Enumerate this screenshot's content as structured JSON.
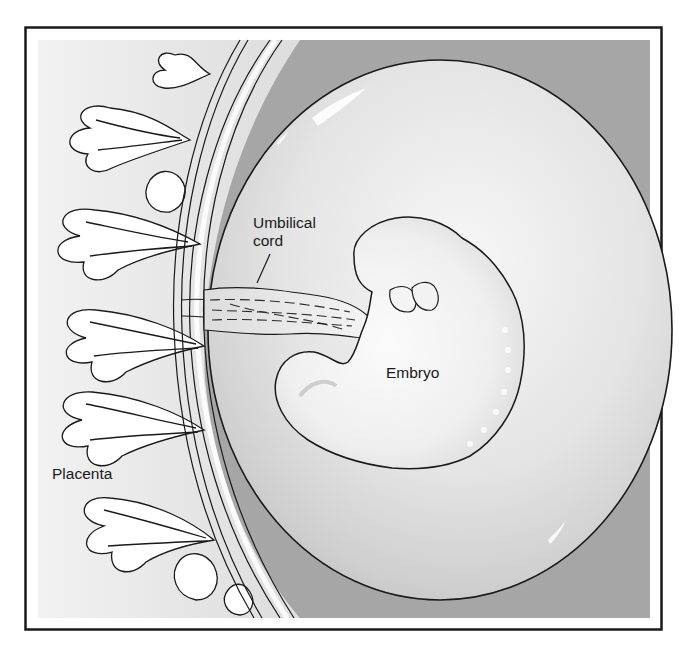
{
  "figure": {
    "type": "anatomical illustration",
    "labels": {
      "umbilical_cord_line1": "Umbilical",
      "umbilical_cord_line2": "cord",
      "embryo": "Embryo",
      "placenta": "Placenta"
    },
    "colors": {
      "frame": "#1a1a1a",
      "background_gray": "#bdbdbd",
      "light_field": "#ececec",
      "sac_fill": "#e6e6e6",
      "uterine_wall": "#9a9a9a",
      "villi_fill": "#ffffff",
      "outline": "#1a1a1a"
    }
  }
}
